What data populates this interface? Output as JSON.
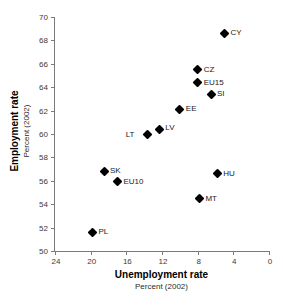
{
  "chart_data": {
    "type": "scatter",
    "title": "",
    "xlabel": "Unemployment rate",
    "xlabel_sub": "Percent (2002)",
    "ylabel": "Employment rate",
    "ylabel_sub": "Percent (2002)",
    "xlim": [
      24,
      0
    ],
    "ylim": [
      50,
      70
    ],
    "x_reversed": true,
    "xticks": [
      24,
      20,
      16,
      12,
      8,
      4,
      0
    ],
    "yticks": [
      50,
      52,
      54,
      56,
      58,
      60,
      62,
      64,
      66,
      68,
      70
    ],
    "grid": false,
    "legend": "none",
    "marker": "filled-diamond",
    "marker_color": "#000000",
    "points": [
      {
        "label": "CY",
        "x": 5.0,
        "y": 68.6
      },
      {
        "label": "CZ",
        "x": 8.0,
        "y": 65.5
      },
      {
        "label": "EU15",
        "x": 8.0,
        "y": 64.4
      },
      {
        "label": "SI",
        "x": 6.5,
        "y": 63.4
      },
      {
        "label": "EE",
        "x": 10.0,
        "y": 62.1
      },
      {
        "label": "LV",
        "x": 12.3,
        "y": 60.4
      },
      {
        "label": "LT",
        "x": 13.6,
        "y": 60.0
      },
      {
        "label": "SK",
        "x": 18.5,
        "y": 56.8
      },
      {
        "label": "EU10",
        "x": 17.0,
        "y": 55.9
      },
      {
        "label": "HU",
        "x": 5.8,
        "y": 56.6
      },
      {
        "label": "MT",
        "x": 7.8,
        "y": 54.5
      },
      {
        "label": "PL",
        "x": 19.8,
        "y": 51.6
      }
    ]
  },
  "axes": {
    "x_tick_labels": [
      "24",
      "20",
      "16",
      "12",
      "8",
      "4",
      "0"
    ],
    "y_tick_labels": [
      "50",
      "52",
      "54",
      "56",
      "58",
      "60",
      "62",
      "64",
      "66",
      "68",
      "70"
    ]
  }
}
